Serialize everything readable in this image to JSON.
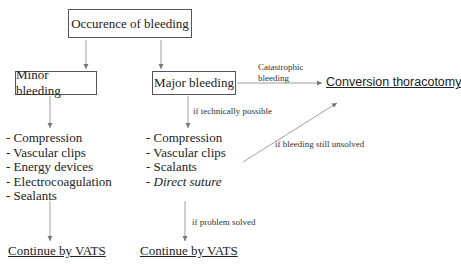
{
  "diagram": {
    "root": {
      "label": "Occurence of bleeding"
    },
    "branches": [
      {
        "label": "Minor bleeding",
        "treatments": [
          {
            "text": "- Compression",
            "italic": false
          },
          {
            "text": "- Vascular clips",
            "italic": false
          },
          {
            "text": "- Energy devices",
            "italic": false
          },
          {
            "text": "- Electrocoagulation",
            "italic": false
          },
          {
            "text": "- Sealants",
            "italic": false
          }
        ],
        "outcome": "Continue by VATS"
      },
      {
        "label": "Major bleeding",
        "condition_to_treatments": "if  technically possible",
        "treatments": [
          {
            "text": "- Compression",
            "italic": false
          },
          {
            "text": "- Vascular clips",
            "italic": false
          },
          {
            "text": "- Scalants",
            "italic": false
          },
          {
            "text": "- Direct suture",
            "italic": true
          }
        ],
        "condition_to_outcome": "if problem solved",
        "outcome": "Continue by VATS"
      }
    ],
    "escalation": {
      "target": "Conversion thoracotomy",
      "catastrophic_label_line1": "Catastrophic",
      "catastrophic_label_line2": "bleeding",
      "unsolved_label": "if bleeding still unsolved"
    },
    "colors": {
      "line": "#777777",
      "text": "#222222",
      "border": "#555555"
    }
  }
}
